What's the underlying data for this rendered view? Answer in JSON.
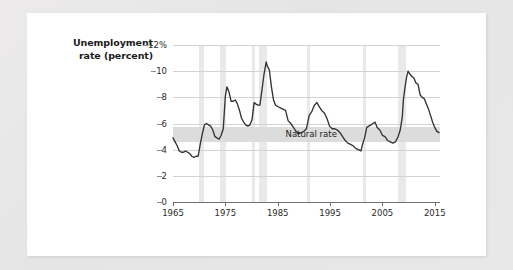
{
  "figure": {
    "axis_title_line1": "Unemployment",
    "axis_title_line2": "rate (percent)",
    "natural_rate_label": "Natural rate",
    "card_background": "#ffffff",
    "page_background": "#e8e8e8",
    "line_color": "#333333",
    "recession_band_color": "#e9e9e9",
    "natural_band_color": "#dcdcdc",
    "gridline_color": "#d3d3d3"
  },
  "chart_data": {
    "type": "line",
    "title": "",
    "subtitle": "",
    "xlabel": "",
    "ylabel": "Unemployment rate (percent)",
    "xlim": [
      1965,
      2016
    ],
    "ylim": [
      0,
      12
    ],
    "grid": true,
    "legend": "none",
    "y_ticks": [
      0,
      2,
      4,
      6,
      8,
      10,
      12
    ],
    "y_tick_labels": [
      "0",
      "2",
      "4",
      "6",
      "8",
      "10",
      "12%"
    ],
    "x_ticks": [
      1965,
      1975,
      1985,
      1995,
      2005,
      2015
    ],
    "x_tick_labels": [
      "1965",
      "1975",
      "1985",
      "1995",
      "2005",
      "2015"
    ],
    "annotations": [
      {
        "text": "Natural rate",
        "x": 1986.5,
        "y": 5.15,
        "kind": "band-label"
      }
    ],
    "bands": {
      "natural_rate": {
        "label": "Natural rate",
        "y_low": 4.6,
        "y_high": 5.75,
        "x_start": 1965,
        "x_end": 2016,
        "color": "#dcdcdc"
      },
      "recessions": [
        {
          "start": 1969.9,
          "end": 1970.9
        },
        {
          "start": 1973.9,
          "end": 1975.2
        },
        {
          "start": 1980.0,
          "end": 1980.6
        },
        {
          "start": 1981.5,
          "end": 1982.9
        },
        {
          "start": 1990.6,
          "end": 1991.2
        },
        {
          "start": 2001.2,
          "end": 2001.9
        },
        {
          "start": 2007.9,
          "end": 2009.5
        }
      ]
    },
    "series": [
      {
        "name": "Unemployment rate",
        "color": "#333333",
        "x": [
          1965.0,
          1965.4,
          1965.8,
          1966.2,
          1966.6,
          1967.0,
          1967.4,
          1967.8,
          1968.2,
          1968.6,
          1969.0,
          1969.4,
          1969.8,
          1970.2,
          1970.6,
          1971.0,
          1971.4,
          1971.8,
          1972.2,
          1972.6,
          1973.0,
          1973.4,
          1973.8,
          1974.2,
          1974.6,
          1975.0,
          1975.3,
          1975.7,
          1976.1,
          1976.5,
          1976.9,
          1977.3,
          1977.7,
          1978.1,
          1978.5,
          1978.9,
          1979.3,
          1979.7,
          1980.1,
          1980.5,
          1980.8,
          1981.2,
          1981.6,
          1982.0,
          1982.4,
          1982.8,
          1983.0,
          1983.4,
          1983.8,
          1984.2,
          1984.6,
          1985.0,
          1985.5,
          1986.0,
          1986.5,
          1987.0,
          1987.5,
          1988.0,
          1988.5,
          1989.0,
          1989.5,
          1990.0,
          1990.5,
          1991.0,
          1991.5,
          1992.0,
          1992.5,
          1992.9,
          1993.4,
          1993.9,
          1994.4,
          1994.9,
          1995.4,
          1995.9,
          1996.4,
          1996.9,
          1997.4,
          1997.9,
          1998.4,
          1998.9,
          1999.4,
          1999.9,
          2000.4,
          2000.9,
          2001.2,
          2001.6,
          2002.0,
          2002.4,
          2002.8,
          2003.2,
          2003.6,
          2004.0,
          2004.5,
          2005.0,
          2005.5,
          2006.0,
          2006.5,
          2007.0,
          2007.5,
          2008.0,
          2008.4,
          2008.8,
          2009.0,
          2009.3,
          2009.6,
          2009.9,
          2010.2,
          2010.6,
          2011.0,
          2011.4,
          2011.8,
          2012.2,
          2012.6,
          2013.0,
          2013.4,
          2013.8,
          2014.2,
          2014.6,
          2015.0,
          2015.4,
          2015.8
        ],
        "y": [
          4.9,
          4.6,
          4.3,
          3.9,
          3.8,
          3.8,
          3.9,
          3.8,
          3.7,
          3.5,
          3.4,
          3.5,
          3.5,
          4.4,
          5.2,
          5.9,
          6.0,
          5.9,
          5.8,
          5.5,
          5.0,
          4.9,
          4.8,
          5.1,
          5.6,
          8.1,
          8.8,
          8.4,
          7.7,
          7.7,
          7.8,
          7.5,
          7.0,
          6.4,
          6.1,
          5.9,
          5.8,
          5.9,
          6.3,
          7.6,
          7.5,
          7.4,
          7.4,
          8.6,
          9.8,
          10.7,
          10.4,
          10.1,
          8.8,
          7.8,
          7.4,
          7.3,
          7.2,
          7.1,
          7.0,
          6.2,
          6.0,
          5.7,
          5.4,
          5.2,
          5.3,
          5.4,
          5.6,
          6.6,
          6.9,
          7.4,
          7.6,
          7.3,
          7.0,
          6.8,
          6.4,
          5.8,
          5.6,
          5.6,
          5.5,
          5.3,
          5.0,
          4.7,
          4.5,
          4.4,
          4.3,
          4.1,
          4.0,
          3.9,
          4.4,
          4.9,
          5.7,
          5.8,
          5.9,
          6.0,
          6.1,
          5.7,
          5.5,
          5.1,
          5.0,
          4.7,
          4.6,
          4.5,
          4.6,
          5.0,
          5.5,
          6.5,
          7.8,
          8.7,
          9.5,
          10.0,
          9.8,
          9.6,
          9.5,
          9.1,
          9.0,
          8.2,
          8.0,
          7.9,
          7.5,
          7.1,
          6.6,
          6.1,
          5.7,
          5.4,
          5.3
        ]
      }
    ]
  }
}
